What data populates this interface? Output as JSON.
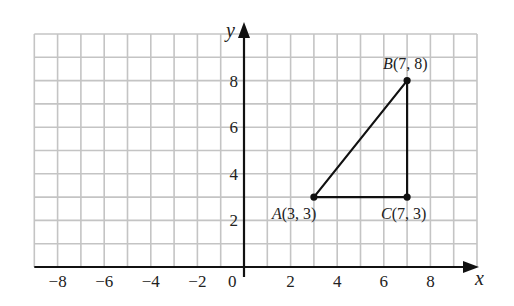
{
  "diagram": {
    "type": "coordinate-grid",
    "axes": {
      "x_label": "x",
      "y_label": "y",
      "origin_label": "0",
      "x_ticks": [
        "−8",
        "−6",
        "−4",
        "−2",
        "2",
        "4",
        "6",
        "8"
      ],
      "x_tick_values": [
        -8,
        -6,
        -4,
        -2,
        2,
        4,
        6,
        8
      ],
      "y_ticks": [
        "2",
        "4",
        "6",
        "8"
      ],
      "y_tick_values": [
        2,
        4,
        6,
        8
      ],
      "x_range": [
        -9,
        10
      ],
      "y_range": [
        0,
        10
      ]
    },
    "grid": {
      "on": true,
      "color": "#c4c4c4",
      "step": 1
    },
    "shape": "triangle",
    "points": [
      {
        "name": "A",
        "x": 3,
        "y": 3,
        "label_coords": "(3, 3)"
      },
      {
        "name": "B",
        "x": 7,
        "y": 8,
        "label_coords": "(7, 8)"
      },
      {
        "name": "C",
        "x": 7,
        "y": 3,
        "label_coords": "(7, 3)"
      }
    ],
    "colors": {
      "line": "#111111",
      "axis": "#111111",
      "grid": "#c4c4c4"
    }
  }
}
